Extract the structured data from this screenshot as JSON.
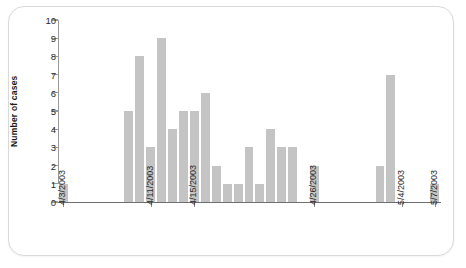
{
  "chart_data": {
    "type": "bar",
    "title": "",
    "xlabel": "",
    "ylabel": "Number of cases",
    "ylim": [
      0,
      10
    ],
    "ytick_labels": [
      "0",
      "1",
      "2",
      "3",
      "4",
      "5",
      "6",
      "7",
      "8",
      "9",
      "10"
    ],
    "ytick_values": [
      0,
      1,
      2,
      3,
      4,
      5,
      6,
      7,
      8,
      9,
      10
    ],
    "grid": false,
    "legend": null,
    "bar_color": "#c4c4c4",
    "axis_color": "#8a8a8a",
    "xtick_labels": [
      "4/3/2003",
      "4/11/2003",
      "4/15/2003",
      "4/26/2003",
      "5/4/2003",
      "5/7/2003"
    ],
    "xtick_indices": [
      0,
      8,
      12,
      23,
      31,
      34
    ],
    "categories": [
      "4/3/2003",
      "4/4/2003",
      "4/5/2003",
      "4/6/2003",
      "4/7/2003",
      "4/8/2003",
      "4/9/2003",
      "4/10/2003",
      "4/11/2003",
      "4/12/2003",
      "4/13/2003",
      "4/14/2003",
      "4/15/2003",
      "4/16/2003",
      "4/17/2003",
      "4/18/2003",
      "4/19/2003",
      "4/20/2003",
      "4/21/2003",
      "4/22/2003",
      "4/23/2003",
      "4/24/2003",
      "4/25/2003",
      "4/26/2003",
      "4/27/2003",
      "4/28/2003",
      "4/29/2003",
      "4/30/2003",
      "5/1/2003",
      "5/2/2003",
      "5/3/2003",
      "5/4/2003",
      "5/5/2003",
      "5/6/2003",
      "5/7/2003"
    ],
    "values": [
      1,
      0,
      0,
      0,
      0,
      0,
      5,
      8,
      3,
      9,
      4,
      5,
      5,
      6,
      2,
      1,
      1,
      3,
      1,
      4,
      3,
      3,
      0,
      2,
      0,
      0,
      0,
      0,
      0,
      2,
      7,
      0,
      0,
      0,
      1
    ]
  }
}
